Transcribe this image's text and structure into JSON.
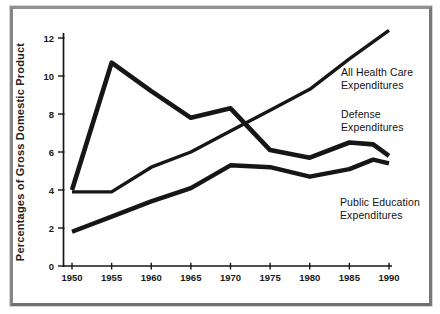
{
  "chart_data": {
    "type": "line",
    "title": "",
    "xlabel": "",
    "ylabel": "Percentages of Gross Domestic Product",
    "x_ticks": [
      1950,
      1955,
      1960,
      1965,
      1970,
      1975,
      1980,
      1985,
      1990
    ],
    "y_ticks": [
      0,
      2,
      4,
      6,
      8,
      10,
      12
    ],
    "xlim": [
      1950,
      1990
    ],
    "ylim": [
      0,
      13
    ],
    "grid": false,
    "legend_position": "inline-annotations",
    "line_color": "#161616",
    "background_color": "#ffffff",
    "frame_border_color": "#8a8a8a",
    "series": [
      {
        "key": "health",
        "name": "All Health Care Expenditures",
        "x": [
          1950,
          1955,
          1960,
          1965,
          1970,
          1975,
          1980,
          1985,
          1990
        ],
        "values": [
          3.9,
          3.9,
          5.2,
          6.0,
          7.1,
          8.2,
          9.3,
          10.9,
          12.4
        ]
      },
      {
        "key": "defense",
        "name": "Defense Expenditures",
        "x": [
          1950,
          1955,
          1960,
          1965,
          1970,
          1975,
          1980,
          1985,
          1988,
          1990
        ],
        "values": [
          4.0,
          10.7,
          9.2,
          7.8,
          8.3,
          6.1,
          5.7,
          6.5,
          6.4,
          5.8
        ]
      },
      {
        "key": "education",
        "name": "Public Education Expenditures",
        "x": [
          1950,
          1955,
          1960,
          1965,
          1970,
          1975,
          1980,
          1985,
          1988,
          1990
        ],
        "values": [
          1.8,
          2.6,
          3.4,
          4.1,
          5.3,
          5.2,
          4.7,
          5.1,
          5.6,
          5.4
        ]
      }
    ],
    "annotations": [
      {
        "key": "health",
        "line1": "All Health Care",
        "line2": "Expenditures"
      },
      {
        "key": "defense",
        "line1": "Defense",
        "line2": "Expenditures"
      },
      {
        "key": "education",
        "line1": "Public Education",
        "line2": "Expenditures"
      }
    ]
  }
}
